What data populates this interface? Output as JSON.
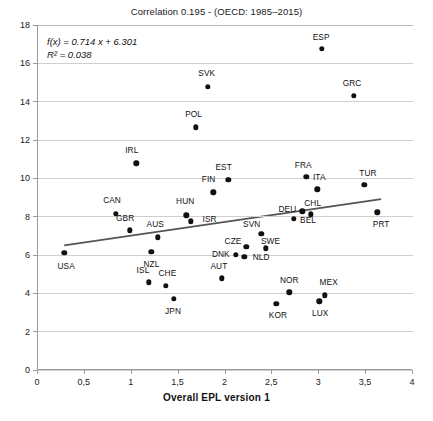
{
  "chart_data": {
    "type": "scatter",
    "title": "Correlation 0.195 - (OECD: 1985–2015)",
    "xlabel": "Overall EPL version 1",
    "ylabel": "",
    "xlim": [
      0,
      4
    ],
    "ylim": [
      0,
      18
    ],
    "xticks": [
      0,
      0.5,
      1,
      1.5,
      2,
      2.5,
      3,
      3.5,
      4
    ],
    "xticklabels": [
      "0",
      "0,5",
      "1",
      "1,5",
      "2",
      "2,5",
      "3",
      "3,5",
      "4"
    ],
    "yticks": [
      0,
      2,
      4,
      6,
      8,
      10,
      12,
      14,
      16,
      18
    ],
    "yticklabels": [
      "0",
      "2",
      "4",
      "6",
      "8",
      "10",
      "12",
      "14",
      "16",
      "18"
    ],
    "grid": "horizontal",
    "legend": "none",
    "annotations": {
      "equation": "f(x) = 0.714 x + 6.301",
      "r_squared": "R² = 0.038",
      "correlation": 0.195,
      "slope": 0.714,
      "intercept": 6.301
    },
    "trendline": {
      "slope": 0.714,
      "intercept": 6.301,
      "x_start": 0.28,
      "x_end": 3.66,
      "color": "#555555"
    },
    "marker_color": "#111111",
    "points": [
      {
        "label": "USA",
        "x": 0.28,
        "y": 6.1,
        "lx": 0.3,
        "ly": 5.45
      },
      {
        "label": "CAN",
        "x": 0.83,
        "y": 8.15,
        "lx": 0.79,
        "ly": 8.85
      },
      {
        "label": "GBR",
        "x": 0.98,
        "y": 7.28,
        "lx": 0.93,
        "ly": 7.95
      },
      {
        "label": "AUS",
        "x": 1.28,
        "y": 6.92,
        "lx": 1.25,
        "ly": 7.62
      },
      {
        "label": "NZL",
        "x": 1.21,
        "y": 6.18,
        "lx": 1.21,
        "ly": 5.55
      },
      {
        "label": "ISL",
        "x": 1.18,
        "y": 4.57,
        "lx": 1.12,
        "ly": 5.2
      },
      {
        "label": "CHE",
        "x": 1.36,
        "y": 4.38,
        "lx": 1.38,
        "ly": 5.08
      },
      {
        "label": "JPN",
        "x": 1.45,
        "y": 3.73,
        "lx": 1.44,
        "ly": 3.1
      },
      {
        "label": "IRL",
        "x": 1.05,
        "y": 10.78,
        "lx": 1.0,
        "ly": 11.48
      },
      {
        "label": "HUN",
        "x": 1.58,
        "y": 8.07,
        "lx": 1.57,
        "ly": 8.8
      },
      {
        "label": "ISR",
        "x": 1.63,
        "y": 7.75,
        "lx": 1.83,
        "ly": 7.9
      },
      {
        "label": "POL",
        "x": 1.68,
        "y": 12.67,
        "lx": 1.66,
        "ly": 13.38
      },
      {
        "label": "SVK",
        "x": 1.81,
        "y": 14.78,
        "lx": 1.8,
        "ly": 15.48
      },
      {
        "label": "FIN",
        "x": 1.87,
        "y": 9.28,
        "lx": 1.82,
        "ly": 9.95
      },
      {
        "label": "EST",
        "x": 2.03,
        "y": 9.92,
        "lx": 1.98,
        "ly": 10.6
      },
      {
        "label": "AUT",
        "x": 1.96,
        "y": 4.78,
        "lx": 1.93,
        "ly": 5.45
      },
      {
        "label": "DNK",
        "x": 2.11,
        "y": 6.02,
        "lx": 1.95,
        "ly": 6.05
      },
      {
        "label": "NLD",
        "x": 2.2,
        "y": 5.9,
        "lx": 2.38,
        "ly": 5.88
      },
      {
        "label": "CZE",
        "x": 2.22,
        "y": 6.43,
        "lx": 2.08,
        "ly": 6.72
      },
      {
        "label": "SVN",
        "x": 2.38,
        "y": 7.1,
        "lx": 2.28,
        "ly": 7.6
      },
      {
        "label": "SWE",
        "x": 2.43,
        "y": 6.35,
        "lx": 2.48,
        "ly": 6.72
      },
      {
        "label": "KOR",
        "x": 2.54,
        "y": 3.46,
        "lx": 2.56,
        "ly": 2.85
      },
      {
        "label": "NOR",
        "x": 2.68,
        "y": 4.05,
        "lx": 2.68,
        "ly": 4.72
      },
      {
        "label": "DEU",
        "x": 2.73,
        "y": 7.88,
        "lx": 2.66,
        "ly": 8.38
      },
      {
        "label": "BEL",
        "x": 2.82,
        "y": 8.28,
        "lx": 2.88,
        "ly": 7.82
      },
      {
        "label": "FRA",
        "x": 2.86,
        "y": 10.08,
        "lx": 2.83,
        "ly": 10.72
      },
      {
        "label": "CHL",
        "x": 2.91,
        "y": 8.13,
        "lx": 2.93,
        "ly": 8.72
      },
      {
        "label": "ITA",
        "x": 2.98,
        "y": 9.42,
        "lx": 3.0,
        "ly": 10.05
      },
      {
        "label": "LUX",
        "x": 3.0,
        "y": 3.58,
        "lx": 3.01,
        "ly": 2.95
      },
      {
        "label": "ESP",
        "x": 3.03,
        "y": 16.75,
        "lx": 3.02,
        "ly": 17.4
      },
      {
        "label": "MEX",
        "x": 3.06,
        "y": 3.9,
        "lx": 3.1,
        "ly": 4.6
      },
      {
        "label": "GRC",
        "x": 3.37,
        "y": 14.3,
        "lx": 3.35,
        "ly": 15.0
      },
      {
        "label": "TUR",
        "x": 3.48,
        "y": 9.65,
        "lx": 3.52,
        "ly": 10.3
      },
      {
        "label": "PRT",
        "x": 3.62,
        "y": 8.22,
        "lx": 3.66,
        "ly": 7.62
      }
    ]
  }
}
